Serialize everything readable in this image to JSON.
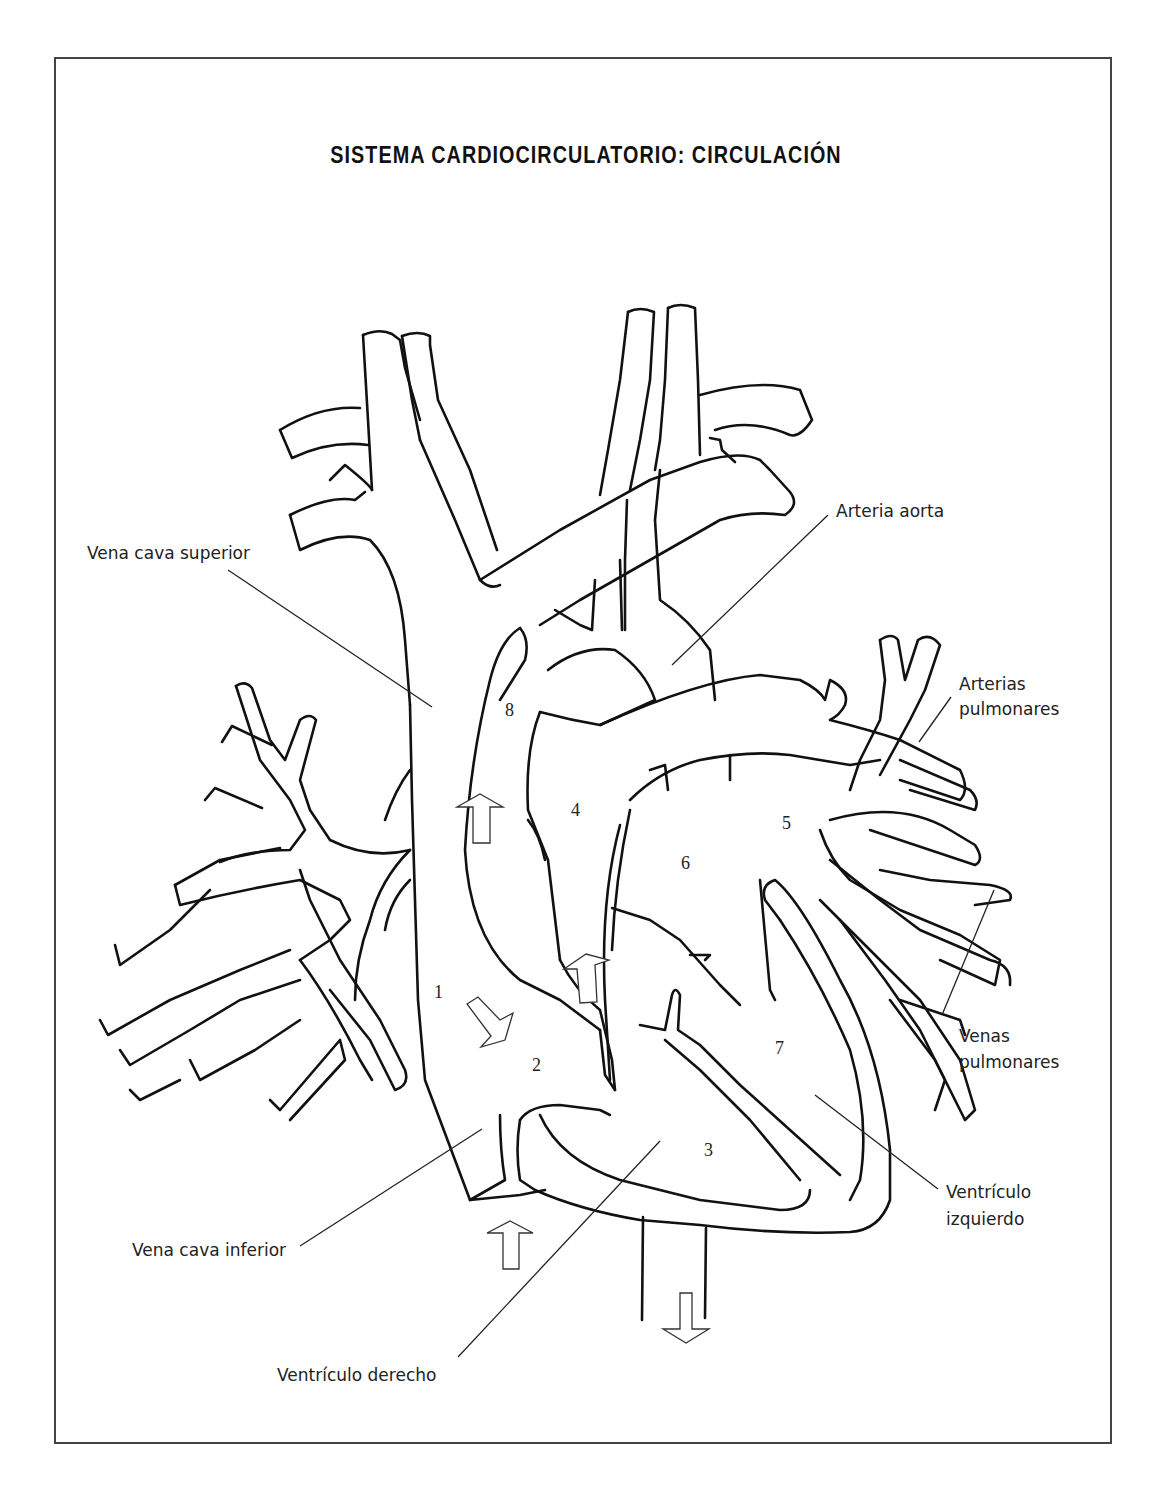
{
  "title": "SISTEMA CARDIOCIRCULATORIO: CIRCULACIÓN",
  "labels": {
    "vena_cava_superior": "Vena cava superior",
    "arteria_aorta": "Arteria aorta",
    "arterias_pulmonares_1": "Arterias",
    "arterias_pulmonares_2": "pulmonares",
    "venas_pulmonares_1": "Venas",
    "venas_pulmonares_2": "pulmonares",
    "ventriculo_izquierdo_1": "Ventrículo",
    "ventriculo_izquierdo_2": "izquierdo",
    "vena_cava_inferior": "Vena cava inferior",
    "ventriculo_derecho": "Ventrículo derecho"
  },
  "numbers": {
    "n1": "1",
    "n2": "2",
    "n3": "3",
    "n4": "4",
    "n5": "5",
    "n6": "6",
    "n7": "7",
    "n8": "8"
  },
  "arrows": [
    {
      "id": "arrow-up-aorta-ascending",
      "direction": "up"
    },
    {
      "id": "arrow-diag-atrium",
      "direction": "down-right"
    },
    {
      "id": "arrow-up-pulmonary",
      "direction": "up"
    },
    {
      "id": "arrow-up-ivc",
      "direction": "up"
    },
    {
      "id": "arrow-down-descending-aorta",
      "direction": "down"
    }
  ]
}
